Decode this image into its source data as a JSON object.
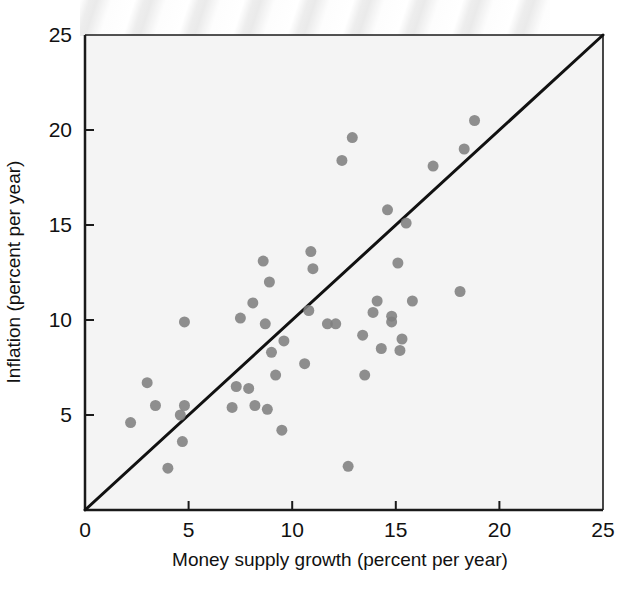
{
  "figure": {
    "kind": "scatter-plot",
    "background_color": "#ffffff",
    "plot_area_color": "#f4f4f4"
  },
  "chart_data": {
    "type": "scatter",
    "title": "",
    "xlabel": "Money supply growth (percent per year)",
    "ylabel": "Inflation (percent per year)",
    "xlim": [
      0,
      25
    ],
    "ylim": [
      0,
      25
    ],
    "xticks": [
      0,
      5,
      10,
      15,
      20,
      25
    ],
    "yticks": [
      0,
      5,
      10,
      15,
      20,
      25
    ],
    "xtick_labels": [
      "0",
      "5",
      "10",
      "15",
      "20",
      "25"
    ],
    "ytick_labels": [
      "",
      "5",
      "10",
      "15",
      "20",
      "25"
    ],
    "grid": false,
    "legend": "none",
    "marker_color": "#808080",
    "marker_size_px": 11,
    "reference_line": {
      "name": "45-degree line",
      "color": "#111111",
      "width_px": 3,
      "from": [
        0,
        0
      ],
      "to": [
        25,
        25
      ]
    },
    "points": [
      {
        "x": 2.2,
        "y": 4.6
      },
      {
        "x": 3.0,
        "y": 6.7
      },
      {
        "x": 3.4,
        "y": 5.5
      },
      {
        "x": 4.0,
        "y": 2.2
      },
      {
        "x": 4.6,
        "y": 5.0
      },
      {
        "x": 4.7,
        "y": 3.6
      },
      {
        "x": 4.8,
        "y": 5.5
      },
      {
        "x": 4.8,
        "y": 9.9
      },
      {
        "x": 7.1,
        "y": 5.4
      },
      {
        "x": 7.3,
        "y": 6.5
      },
      {
        "x": 7.5,
        "y": 10.1
      },
      {
        "x": 7.9,
        "y": 6.4
      },
      {
        "x": 8.1,
        "y": 10.9
      },
      {
        "x": 8.2,
        "y": 5.5
      },
      {
        "x": 8.6,
        "y": 13.1
      },
      {
        "x": 8.7,
        "y": 9.8
      },
      {
        "x": 8.8,
        "y": 5.3
      },
      {
        "x": 8.9,
        "y": 12.0
      },
      {
        "x": 9.0,
        "y": 8.3
      },
      {
        "x": 9.2,
        "y": 7.1
      },
      {
        "x": 9.5,
        "y": 4.2
      },
      {
        "x": 9.6,
        "y": 8.9
      },
      {
        "x": 10.6,
        "y": 7.7
      },
      {
        "x": 10.8,
        "y": 10.5
      },
      {
        "x": 10.9,
        "y": 13.6
      },
      {
        "x": 11.0,
        "y": 12.7
      },
      {
        "x": 11.7,
        "y": 9.8
      },
      {
        "x": 12.1,
        "y": 9.8
      },
      {
        "x": 12.4,
        "y": 18.4
      },
      {
        "x": 12.7,
        "y": 2.3
      },
      {
        "x": 12.9,
        "y": 19.6
      },
      {
        "x": 13.4,
        "y": 9.2
      },
      {
        "x": 13.5,
        "y": 7.1
      },
      {
        "x": 13.9,
        "y": 10.4
      },
      {
        "x": 14.1,
        "y": 11.0
      },
      {
        "x": 14.3,
        "y": 8.5
      },
      {
        "x": 14.6,
        "y": 15.8
      },
      {
        "x": 14.8,
        "y": 10.2
      },
      {
        "x": 14.8,
        "y": 9.9
      },
      {
        "x": 15.1,
        "y": 13.0
      },
      {
        "x": 15.2,
        "y": 8.4
      },
      {
        "x": 15.3,
        "y": 9.0
      },
      {
        "x": 15.5,
        "y": 15.1
      },
      {
        "x": 15.8,
        "y": 11.0
      },
      {
        "x": 16.8,
        "y": 18.1
      },
      {
        "x": 18.1,
        "y": 11.5
      },
      {
        "x": 18.3,
        "y": 19.0
      },
      {
        "x": 18.8,
        "y": 20.5
      }
    ]
  }
}
